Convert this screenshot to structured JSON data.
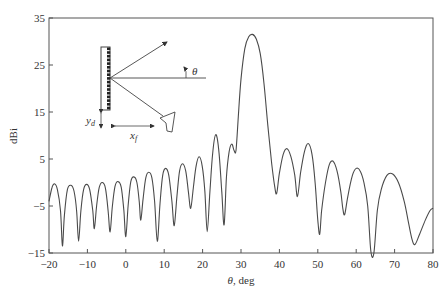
{
  "chart_data": {
    "type": "line",
    "title": "",
    "xlabel": "θ, deg",
    "ylabel": "dBi",
    "xlim": [
      -20,
      80
    ],
    "ylim": [
      -15,
      35
    ],
    "xticks": [
      -20,
      -10,
      0,
      10,
      20,
      30,
      40,
      50,
      60,
      70,
      80
    ],
    "yticks": [
      -15,
      -5,
      5,
      15,
      25,
      35
    ],
    "grid": false,
    "legend": null,
    "series": [
      {
        "name": "Radiation pattern",
        "points": [
          [
            -20,
            -4
          ],
          [
            -19.2,
            -1
          ],
          [
            -18.5,
            -0.3
          ],
          [
            -17.8,
            -1.5
          ],
          [
            -17,
            -6
          ],
          [
            -16.5,
            -13.5
          ],
          [
            -16,
            -7
          ],
          [
            -15.2,
            -1.5
          ],
          [
            -14.3,
            -0.6
          ],
          [
            -13.5,
            -1.8
          ],
          [
            -12.8,
            -6
          ],
          [
            -12.3,
            -12.5
          ],
          [
            -11.7,
            -6
          ],
          [
            -11,
            -1.5
          ],
          [
            -10.2,
            -0.4
          ],
          [
            -9.4,
            -1.5
          ],
          [
            -8.6,
            -6
          ],
          [
            -8.2,
            -9.8
          ],
          [
            -7.6,
            -5
          ],
          [
            -6.9,
            -1
          ],
          [
            -6.1,
            0
          ],
          [
            -5.3,
            -1.2
          ],
          [
            -4.6,
            -6
          ],
          [
            -4.1,
            -10.5
          ],
          [
            -3.5,
            -5
          ],
          [
            -2.8,
            -0.8
          ],
          [
            -2,
            0.2
          ],
          [
            -1.2,
            -1
          ],
          [
            -0.5,
            -6
          ],
          [
            0,
            -11.5
          ],
          [
            0.6,
            -5
          ],
          [
            1.3,
            0.2
          ],
          [
            2.1,
            1.2
          ],
          [
            2.9,
            0
          ],
          [
            3.5,
            -4
          ],
          [
            3.9,
            -8
          ],
          [
            4.5,
            -3.5
          ],
          [
            5.2,
            1
          ],
          [
            6,
            2.2
          ],
          [
            6.8,
            1
          ],
          [
            7.5,
            -4
          ],
          [
            8.2,
            -12.5
          ],
          [
            8.9,
            -4.5
          ],
          [
            9.6,
            1.5
          ],
          [
            10.4,
            3
          ],
          [
            11.2,
            1.5
          ],
          [
            12,
            -4
          ],
          [
            12.6,
            -9.2
          ],
          [
            13.3,
            -3
          ],
          [
            14,
            2.5
          ],
          [
            14.8,
            4
          ],
          [
            15.6,
            2.5
          ],
          [
            16.3,
            -2
          ],
          [
            16.9,
            -5.5
          ],
          [
            17.6,
            -1
          ],
          [
            18.3,
            3.5
          ],
          [
            19.1,
            5.5
          ],
          [
            19.9,
            3.5
          ],
          [
            20.6,
            -2
          ],
          [
            21.2,
            -10.5
          ],
          [
            21.9,
            -2
          ],
          [
            22.6,
            6
          ],
          [
            23.4,
            10.2
          ],
          [
            24.2,
            7
          ],
          [
            25,
            -2
          ],
          [
            25.6,
            -9
          ],
          [
            26.2,
            1
          ],
          [
            26.9,
            6.5
          ],
          [
            27.6,
            8.2
          ],
          [
            28.2,
            6.8
          ],
          [
            28.7,
            6.8
          ],
          [
            29.3,
            14
          ],
          [
            30,
            22
          ],
          [
            31,
            28.5
          ],
          [
            32,
            31
          ],
          [
            33,
            31.5
          ],
          [
            34,
            30.5
          ],
          [
            35,
            27.5
          ],
          [
            36,
            21
          ],
          [
            37,
            12
          ],
          [
            38,
            4
          ],
          [
            38.8,
            -1
          ],
          [
            39.3,
            -2.3
          ],
          [
            40,
            2
          ],
          [
            41,
            6
          ],
          [
            42,
            7.2
          ],
          [
            43,
            5.5
          ],
          [
            44,
            1.5
          ],
          [
            44.7,
            -3
          ],
          [
            45.5,
            2
          ],
          [
            46.5,
            6.5
          ],
          [
            47.5,
            8.3
          ],
          [
            48.5,
            6
          ],
          [
            49.3,
            0
          ],
          [
            50,
            -8
          ],
          [
            50.5,
            -11
          ],
          [
            51,
            -6
          ],
          [
            52,
            0
          ],
          [
            53,
            3.8
          ],
          [
            54,
            4.5
          ],
          [
            55,
            2.5
          ],
          [
            56,
            -2
          ],
          [
            56.5,
            -5.5
          ],
          [
            57,
            -6.8
          ],
          [
            57.8,
            -3
          ],
          [
            59,
            1.5
          ],
          [
            60,
            3
          ],
          [
            61,
            2.5
          ],
          [
            62,
            0
          ],
          [
            63,
            -5
          ],
          [
            63.8,
            -14.5
          ],
          [
            64.6,
            -15
          ],
          [
            65.5,
            -6
          ],
          [
            66.5,
            -1.5
          ],
          [
            68,
            1.5
          ],
          [
            69.5,
            1.8
          ],
          [
            71,
            0
          ],
          [
            72.5,
            -4
          ],
          [
            73.5,
            -8
          ],
          [
            74.5,
            -12
          ],
          [
            75.3,
            -13.2
          ],
          [
            76.5,
            -11
          ],
          [
            78,
            -8
          ],
          [
            79.2,
            -6
          ],
          [
            80,
            -5.5
          ]
        ]
      }
    ],
    "annotations": [
      {
        "text": "θ",
        "type": "inset-angle-label"
      },
      {
        "text": "y_d",
        "type": "inset-dimension-label"
      },
      {
        "text": "x_f",
        "type": "inset-dimension-label"
      }
    ],
    "inset": "Reflectarray schematic: vertical array of elements, feed horn at offset (x_f, y_d), arrows showing incident and reflected beams, angle θ from broadside"
  },
  "axes": {
    "xlabel_main": "θ",
    "xlabel_unit": ", deg",
    "ylabel": "dBi",
    "xticks": [
      "−20",
      "−10",
      "0",
      "10",
      "20",
      "30",
      "40",
      "50",
      "60",
      "70",
      "80"
    ],
    "yticks": [
      "35",
      "25",
      "15",
      "5",
      "−5",
      "−15"
    ]
  },
  "inset": {
    "theta": "θ",
    "yd_main": "y",
    "yd_sub": "d",
    "xf_main": "x",
    "xf_sub": "f"
  },
  "colors": {
    "line": "#4a4a4a",
    "axis": "#555555",
    "background": "#ffffff"
  }
}
